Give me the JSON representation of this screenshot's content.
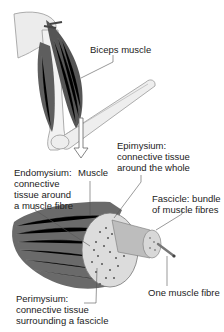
{
  "diagram": {
    "labels": {
      "biceps": "Biceps muscle",
      "epimysium": [
        "Epimysium:",
        "connective tissue",
        "around the whole"
      ],
      "endomysium": [
        "Endomysium:",
        "connective",
        "tissue around",
        "a muscle fibre"
      ],
      "muscle": "Muscle",
      "fascicle": [
        "Fascicle: bundle",
        "of muscle fibres"
      ],
      "perimysium": [
        "Perimysium:",
        "connective tissue",
        "surrounding a fascicle"
      ],
      "fibre": "One muscle fibre"
    },
    "colors": {
      "muscle_dark": "#5a5a5a",
      "bone": "#ececec",
      "outline": "#888888",
      "leader": "#555555"
    }
  }
}
